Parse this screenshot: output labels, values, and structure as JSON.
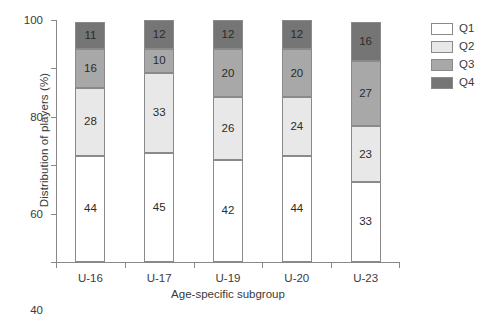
{
  "chart_data": {
    "type": "bar",
    "subtype": "stacked-bar-100-percent",
    "title": "",
    "xlabel": "Age-specific subgroup",
    "ylabel": "Distribution of players (%)",
    "categories": [
      "U-16",
      "U-17",
      "U-19",
      "U-20",
      "U-23"
    ],
    "series": [
      {
        "name": "Q1",
        "color": "#ffffff",
        "values": [
          44,
          45,
          42,
          44,
          33
        ]
      },
      {
        "name": "Q2",
        "color": "#e8e8e8",
        "values": [
          28,
          33,
          26,
          24,
          23
        ]
      },
      {
        "name": "Q3",
        "color": "#a8a8a8",
        "values": [
          16,
          10,
          20,
          20,
          27
        ]
      },
      {
        "name": "Q4",
        "color": "#757575",
        "values": [
          11,
          12,
          12,
          12,
          16
        ]
      }
    ],
    "ylim": [
      0,
      100
    ],
    "yticks": [
      0,
      20,
      40,
      60,
      80,
      100
    ],
    "ytick_labels": [
      "0",
      "20",
      "40",
      "60",
      "80",
      "100"
    ],
    "grid": false,
    "legend_position": "right",
    "legend_entries": [
      "Q1",
      "Q2",
      "Q3",
      "Q4"
    ],
    "bar_border_color": "#8a8a8a",
    "axis_color": "#888888",
    "text_color": "#3a3a3a"
  }
}
